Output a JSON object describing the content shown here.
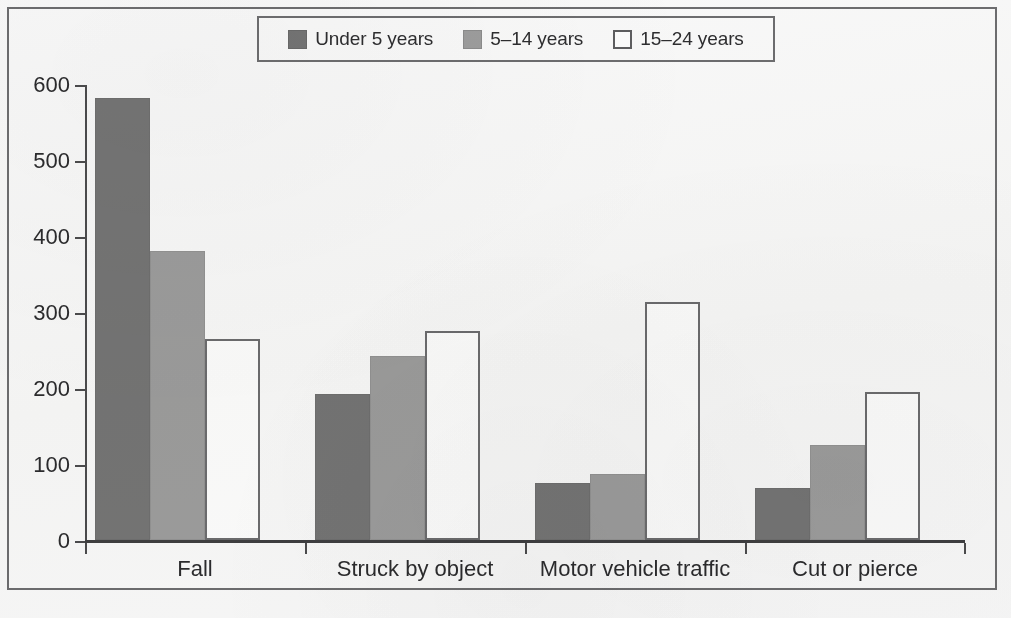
{
  "chart_data": {
    "type": "bar",
    "title": "",
    "subtitle": "",
    "xlabel": "",
    "ylabel": "",
    "categories": [
      "Fall",
      "Struck by object",
      "Motor vehicle traffic",
      "Cut or pierce"
    ],
    "series": [
      {
        "name": "Under 5 years",
        "color": "#767676",
        "values": [
          583,
          381,
          75,
          69
        ]
      },
      {
        "name": "5–14 years",
        "color": "#9e9e9e",
        "values": [
          381,
          242,
          87,
          125
        ]
      },
      {
        "name": "15–24 years",
        "color": "#ffffff",
        "values": [
          265,
          276,
          314,
          195
        ]
      }
    ],
    "series_corrected": [
      {
        "name": "Under 5 years",
        "values": [
          583,
          193,
          75,
          69
        ]
      },
      {
        "name": "5–14 years",
        "values": [
          381,
          242,
          87,
          125
        ]
      },
      {
        "name": "15–24 years",
        "values": [
          265,
          276,
          314,
          195
        ]
      }
    ],
    "ylim": [
      0,
      600
    ],
    "yticks": [
      0,
      100,
      200,
      300,
      400,
      500,
      600
    ],
    "ytick_labels": [
      "0",
      "100",
      "200",
      "300",
      "400",
      "500",
      "600"
    ],
    "grid": false,
    "legend_position": "top-center"
  },
  "legend": {
    "entries": [
      {
        "label": "Under 5 years",
        "swatch": "dark-gray-swatch"
      },
      {
        "label": "5–14 years",
        "swatch": "medium-gray-swatch"
      },
      {
        "label": "15–24 years",
        "swatch": "white-outline-swatch"
      }
    ]
  },
  "axis": {
    "y_labels": [
      "600",
      "500",
      "400",
      "300",
      "200",
      "100",
      "0"
    ],
    "x_labels": [
      "Fall",
      "Struck by object",
      "Motor vehicle traffic",
      "Cut or pierce"
    ]
  }
}
